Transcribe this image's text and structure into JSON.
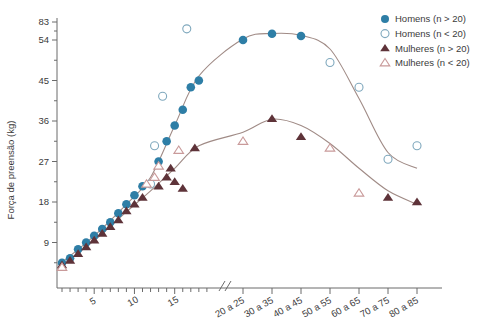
{
  "chart_data": {
    "type": "scatter",
    "title": "",
    "subtitle": "",
    "xlabel": "",
    "ylabel": "Força de preensão (kg)",
    "ylim": [
      0,
      83
    ],
    "grid": false,
    "legend_position": "top-right",
    "axis_breaks": {
      "x": "//",
      "y": "between 54 and 83"
    },
    "y_ticks": [
      9,
      18,
      27,
      36,
      45,
      54,
      83
    ],
    "y_tick_labels": [
      "9",
      "18",
      "27",
      "36",
      "45",
      "54",
      "83"
    ],
    "x_numeric_ticks": [
      1,
      2,
      3,
      4,
      5,
      6,
      7,
      8,
      9,
      10,
      11,
      12,
      13,
      14,
      15,
      16,
      17,
      18,
      19
    ],
    "x_numeric_tick_labels": [
      "5",
      "10",
      "15"
    ],
    "x_numeric_labeled_at": [
      5,
      10,
      15
    ],
    "x_band_labels": [
      "20 a 25",
      "30 a 35",
      "40 a 45",
      "50 a 55",
      "60 a 65",
      "70 a 75",
      "80 a 85"
    ],
    "legend": [
      {
        "label": "Homens (n > 20)",
        "marker": "circle-filled",
        "color": "#2e7ea6"
      },
      {
        "label": "Homens (n < 20)",
        "marker": "circle-open",
        "color": "#7fa8bd"
      },
      {
        "label": "Mulheres (n > 20)",
        "marker": "triangle-filled",
        "color": "#5e3339"
      },
      {
        "label": "Mulheres (n < 20)",
        "marker": "triangle-open",
        "color": "#c99a9a"
      }
    ],
    "series": [
      {
        "name": "Homens (n > 20)",
        "marker": "circle-filled",
        "color": "#2e7ea6",
        "points": [
          {
            "x": 1,
            "y": 4.5
          },
          {
            "x": 2,
            "y": 5.5
          },
          {
            "x": 3,
            "y": 7.5
          },
          {
            "x": 4,
            "y": 9.0
          },
          {
            "x": 5,
            "y": 10.5
          },
          {
            "x": 6,
            "y": 12.0
          },
          {
            "x": 7,
            "y": 13.5
          },
          {
            "x": 8,
            "y": 15.5
          },
          {
            "x": 9,
            "y": 17.5
          },
          {
            "x": 10,
            "y": 19.5
          },
          {
            "x": 11,
            "y": 21.5
          },
          {
            "x": 13,
            "y": 27.0
          },
          {
            "x": 14,
            "y": 31.5
          },
          {
            "x": 15,
            "y": 35.0
          },
          {
            "x": 16,
            "y": 38.5
          },
          {
            "x": 17,
            "y": 43.5
          },
          {
            "x": 18,
            "y": 45.0
          },
          {
            "x": "20 a 25",
            "y": 54.0
          },
          {
            "x": "30 a 35",
            "y": 64.0
          },
          {
            "x": "40 a 45",
            "y": 60.5
          }
        ]
      },
      {
        "name": "Homens (n < 20)",
        "marker": "circle-open",
        "color": "#7fa8bd",
        "points": [
          {
            "x": 12,
            "y": 22.0
          },
          {
            "x": 12.5,
            "y": 30.5
          },
          {
            "x": 13.5,
            "y": 41.5
          },
          {
            "x": 16.5,
            "y": 72.0
          },
          {
            "x": "50 a 55",
            "y": 49.0
          },
          {
            "x": "60 a 65",
            "y": 43.5
          },
          {
            "x": "70 a 75",
            "y": 27.5
          },
          {
            "x": "80 a 85",
            "y": 30.5
          }
        ]
      },
      {
        "name": "Mulheres (n > 20)",
        "marker": "triangle-filled",
        "color": "#5e3339",
        "points": [
          {
            "x": 1,
            "y": 4.0
          },
          {
            "x": 2,
            "y": 5.0
          },
          {
            "x": 3,
            "y": 6.5
          },
          {
            "x": 4,
            "y": 8.0
          },
          {
            "x": 5,
            "y": 9.5
          },
          {
            "x": 6,
            "y": 11.0
          },
          {
            "x": 7,
            "y": 12.5
          },
          {
            "x": 8,
            "y": 14.0
          },
          {
            "x": 9,
            "y": 16.0
          },
          {
            "x": 10,
            "y": 17.5
          },
          {
            "x": 11,
            "y": 19.0
          },
          {
            "x": 13,
            "y": 21.5
          },
          {
            "x": 14,
            "y": 23.5
          },
          {
            "x": 15,
            "y": 22.5
          },
          {
            "x": 14.5,
            "y": 25.5
          },
          {
            "x": 16,
            "y": 21.0
          },
          {
            "x": 17.5,
            "y": 30.0
          },
          {
            "x": "30 a 35",
            "y": 36.5
          },
          {
            "x": "40 a 45",
            "y": 32.5
          },
          {
            "x": "70 a 75",
            "y": 19.0
          },
          {
            "x": "80 a 85",
            "y": 18.0
          }
        ]
      },
      {
        "name": "Mulheres (n < 20)",
        "marker": "triangle-open",
        "color": "#c99a9a",
        "points": [
          {
            "x": 1,
            "y": 3.5
          },
          {
            "x": 11.5,
            "y": 22.0
          },
          {
            "x": 12.5,
            "y": 23.5
          },
          {
            "x": 13.0,
            "y": 26.0
          },
          {
            "x": 15.5,
            "y": 29.5
          },
          {
            "x": "20 a 25",
            "y": 31.5
          },
          {
            "x": "50 a 55",
            "y": 30.0
          },
          {
            "x": "60 a 65",
            "y": 20.0
          }
        ]
      }
    ],
    "fit_curves": [
      {
        "name": "Homens fit",
        "color": "#a08b86",
        "peak_x": "30 a 35",
        "peak_y": 64.5
      },
      {
        "name": "Mulheres fit",
        "color": "#a08b86",
        "peak_x": "30 a 35",
        "peak_y": 36.5
      }
    ]
  }
}
